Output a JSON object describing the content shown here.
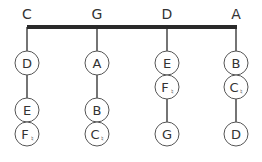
{
  "diagram": {
    "columns": [
      {
        "root": "C",
        "x": 27,
        "nodes": [
          {
            "note": "D",
            "accidental": "",
            "y": 63
          },
          {
            "note": "E",
            "accidental": "",
            "y": 110
          },
          {
            "note": "F",
            "accidental": "♮",
            "y": 134
          }
        ]
      },
      {
        "root": "G",
        "x": 97,
        "nodes": [
          {
            "note": "A",
            "accidental": "",
            "y": 63
          },
          {
            "note": "B",
            "accidental": "",
            "y": 110
          },
          {
            "note": "C",
            "accidental": "♮",
            "y": 134
          }
        ]
      },
      {
        "root": "D",
        "x": 167,
        "nodes": [
          {
            "note": "E",
            "accidental": "",
            "y": 63
          },
          {
            "note": "F",
            "accidental": "♮",
            "y": 87
          },
          {
            "note": "G",
            "accidental": "",
            "y": 134
          }
        ]
      },
      {
        "root": "A",
        "x": 236,
        "nodes": [
          {
            "note": "B",
            "accidental": "",
            "y": 63
          },
          {
            "note": "C",
            "accidental": "♮",
            "y": 87
          },
          {
            "note": "D",
            "accidental": "",
            "y": 134
          }
        ]
      }
    ],
    "colors": {
      "line": "#2a2a2a",
      "circle": "#555555",
      "text": "#333333"
    }
  }
}
